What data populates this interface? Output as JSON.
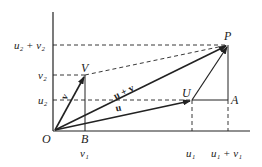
{
  "diagram": {
    "type": "vector-addition",
    "points": {
      "O": {
        "label": "O",
        "x": 55,
        "y": 130
      },
      "B": {
        "label": "B",
        "x": 85,
        "y": 130
      },
      "V": {
        "label": "V",
        "x": 85,
        "y": 75
      },
      "U": {
        "label": "U",
        "x": 192,
        "y": 100
      },
      "A": {
        "label": "A",
        "x": 228,
        "y": 100
      },
      "P": {
        "label": "P",
        "x": 228,
        "y": 45
      }
    },
    "vectors": [
      {
        "name": "u",
        "label": "u",
        "from": "O",
        "to": "U"
      },
      {
        "name": "v",
        "label": "v",
        "from": "O",
        "to": "V"
      },
      {
        "name": "u_plus_v",
        "label": "u + v",
        "from": "O",
        "to": "P"
      },
      {
        "name": "v_translated",
        "label": "",
        "from": "U",
        "to": "P"
      }
    ],
    "axis_labels": {
      "y": [
        {
          "label": "u₂ + v₂",
          "y": 45
        },
        {
          "label": "v₂",
          "y": 75
        },
        {
          "label": "u₂",
          "y": 100
        }
      ],
      "x": [
        {
          "label": "v₁",
          "x": 85
        },
        {
          "label": "u₁",
          "x": 192
        },
        {
          "label": "u₁ + v₁",
          "x": 228
        }
      ]
    },
    "colors": {
      "ink": "#222222",
      "background": "#ffffff"
    }
  }
}
